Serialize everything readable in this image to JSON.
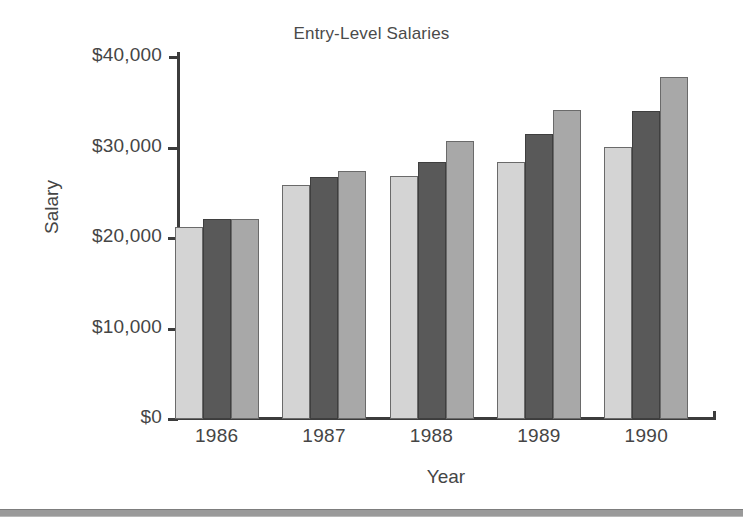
{
  "page": {
    "clipped_top_text": "",
    "bottom_rule_color": "#9a9a9a"
  },
  "chart_data": {
    "type": "bar",
    "title": "Entry-Level Salaries",
    "xlabel": "Year",
    "ylabel": "Salary",
    "categories": [
      "1986",
      "1987",
      "1988",
      "1989",
      "1990"
    ],
    "ylim": [
      0,
      40000
    ],
    "yticks": [
      0,
      10000,
      20000,
      30000,
      40000
    ],
    "ytick_labels": [
      "$0",
      "$10,000",
      "$20,000",
      "$30,000",
      "$40,000"
    ],
    "grid": false,
    "legend": "none",
    "series": [
      {
        "name": "Series 1",
        "color": "#d4d4d4",
        "values": [
          21200,
          25900,
          26900,
          28400,
          30100
        ]
      },
      {
        "name": "Series 2",
        "color": "#595959",
        "values": [
          22100,
          26700,
          28400,
          31500,
          34000
        ]
      },
      {
        "name": "Series 3",
        "color": "#a8a8a8",
        "values": [
          22100,
          27400,
          30700,
          34200,
          37800
        ]
      }
    ]
  }
}
